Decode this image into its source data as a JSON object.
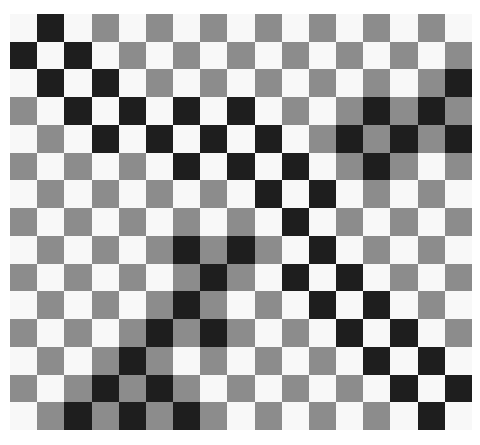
{
  "colors": {
    "W": "#f8f8f8",
    "G": "#8c8c8c",
    "B": "#1e1e1e"
  },
  "grid": {
    "columns": 17,
    "rows": 15,
    "cells": [
      "WBWGWGWGWGWGWGWGW",
      "BWBWGWGWGWGWGWGWG",
      "WBWBWGWGWGWGWGWGB",
      "GWBWBWBWBWGWGBGBG",
      "WGWBWBWBWBWGBGBGB",
      "GWGWGWBWBWBWGBGWG",
      "WGWGWGWGWBWBWGWGW",
      "GWGWGWGWGWBWGWGWG",
      "WGWGWGBGBGWBWGWGW",
      "GWGWGWGBGWBWBWGWG",
      "WGWGWGBGWGWBWBWGW",
      "GWGWGBGBGWGWBWBWG",
      "WGWGBGWGWGWGWBWBW",
      "GWGBGBGWGWGWGWBWB",
      "WGBGBGBGWGWGWGWBW"
    ]
  }
}
